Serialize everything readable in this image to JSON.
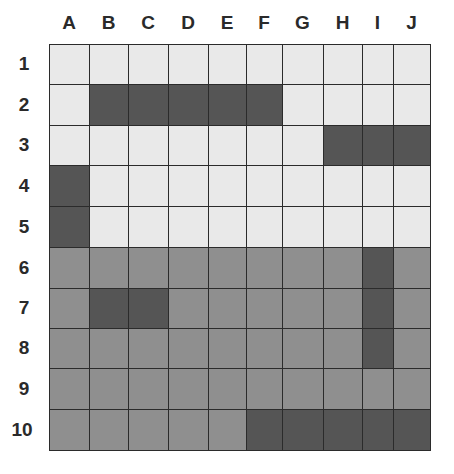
{
  "grid": {
    "columns": [
      "A",
      "B",
      "C",
      "D",
      "E",
      "F",
      "G",
      "H",
      "I",
      "J"
    ],
    "rows": [
      "1",
      "2",
      "3",
      "4",
      "5",
      "6",
      "7",
      "8",
      "9",
      "10"
    ],
    "col_edges": [
      49,
      89,
      128,
      168,
      208,
      246,
      282,
      323,
      362,
      393,
      430
    ],
    "row_edges": [
      44,
      84,
      125,
      165,
      206,
      247,
      288,
      328,
      368,
      409,
      450
    ],
    "colors": {
      "L": "#e9e9e9",
      "M": "#8f8f8f",
      "D": "#555555"
    },
    "cells": [
      [
        "L",
        "L",
        "L",
        "L",
        "L",
        "L",
        "L",
        "L",
        "L",
        "L"
      ],
      [
        "L",
        "D",
        "D",
        "D",
        "D",
        "D",
        "L",
        "L",
        "L",
        "L"
      ],
      [
        "L",
        "L",
        "L",
        "L",
        "L",
        "L",
        "L",
        "D",
        "D",
        "D"
      ],
      [
        "D",
        "L",
        "L",
        "L",
        "L",
        "L",
        "L",
        "L",
        "L",
        "L"
      ],
      [
        "D",
        "L",
        "L",
        "L",
        "L",
        "L",
        "L",
        "L",
        "L",
        "L"
      ],
      [
        "M",
        "M",
        "M",
        "M",
        "M",
        "M",
        "M",
        "M",
        "D",
        "M"
      ],
      [
        "M",
        "D",
        "D",
        "M",
        "M",
        "M",
        "M",
        "M",
        "D",
        "M"
      ],
      [
        "M",
        "M",
        "M",
        "M",
        "M",
        "M",
        "M",
        "M",
        "D",
        "M"
      ],
      [
        "M",
        "M",
        "M",
        "M",
        "M",
        "M",
        "M",
        "M",
        "M",
        "M"
      ],
      [
        "M",
        "M",
        "M",
        "M",
        "M",
        "D",
        "D",
        "D",
        "D",
        "D"
      ]
    ]
  }
}
